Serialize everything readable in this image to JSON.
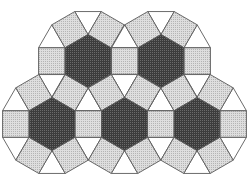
{
  "figure": {
    "width": 252,
    "height": 176,
    "edge_length": 26.5,
    "hexagon_centers": [
      {
        "id": "hex-top-left",
        "x": 88,
        "y": 61
      },
      {
        "id": "hex-top-right",
        "x": 161,
        "y": 61
      },
      {
        "id": "hex-bottom-left",
        "x": 52,
        "y": 124
      },
      {
        "id": "hex-bottom-middle",
        "x": 124.5,
        "y": 124
      },
      {
        "id": "hex-bottom-right",
        "x": 197,
        "y": 124
      }
    ],
    "colors": {
      "background": "#ffffff",
      "hexagon_fill": "#3c3c3c",
      "hexagon_dot": "#6a6a6a",
      "square_fill": "#dedede",
      "square_dot": "#b4b4b4",
      "triangle_fill": "#ffffff",
      "stroke": "#5a5a5a"
    },
    "stroke_width": 0.9,
    "shapes": {
      "hexagon": "dark stippled hexagon",
      "square": "light stippled square",
      "triangle": "white triangle"
    }
  }
}
